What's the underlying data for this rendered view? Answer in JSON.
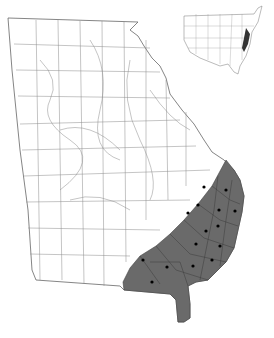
{
  "map": {
    "title": "Georgia county distribution map",
    "region": "Georgia",
    "inset": "United States",
    "colors": {
      "background": "#ffffff",
      "county_lines": "#777777",
      "shaded_range": "#6a6a6a",
      "dots": "#000000",
      "inset_highlight": "#333333"
    },
    "occurrence_dots": [
      [
        204,
        187
      ],
      [
        226,
        190
      ],
      [
        198,
        205
      ],
      [
        188,
        213
      ],
      [
        219,
        210
      ],
      [
        235,
        211
      ],
      [
        218,
        226
      ],
      [
        206,
        231
      ],
      [
        196,
        244
      ],
      [
        220,
        246
      ],
      [
        143,
        260
      ],
      [
        167,
        267
      ],
      [
        193,
        266
      ],
      [
        212,
        260
      ],
      [
        152,
        282
      ]
    ]
  }
}
